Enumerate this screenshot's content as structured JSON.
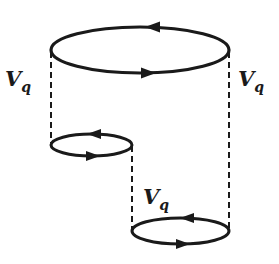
{
  "diagram": {
    "type": "feynman-diagram",
    "colors": {
      "line": "#1a1a1a",
      "background": "#ffffff"
    },
    "loops": [
      {
        "id": "top-loop",
        "position": "top",
        "arrow_top": "left",
        "arrow_bottom": "right"
      },
      {
        "id": "middle-left-loop",
        "position": "middle-left",
        "arrow_top": "left",
        "arrow_bottom": "right"
      },
      {
        "id": "bottom-right-loop",
        "position": "bottom-right",
        "arrow_top": "left",
        "arrow_bottom": "right"
      }
    ],
    "interaction_lines": [
      {
        "id": "left-interaction",
        "connects": [
          "top-loop",
          "middle-left-loop"
        ],
        "style": "dashed"
      },
      {
        "id": "right-interaction",
        "connects": [
          "top-loop",
          "bottom-right-loop"
        ],
        "style": "dashed"
      },
      {
        "id": "middle-interaction",
        "connects": [
          "middle-left-loop",
          "bottom-right-loop"
        ],
        "style": "dashed"
      }
    ],
    "labels": {
      "left": {
        "main": "V",
        "sub": "q"
      },
      "right": {
        "main": "V",
        "sub": "q"
      },
      "middle": {
        "main": "V",
        "sub": "q"
      }
    }
  }
}
